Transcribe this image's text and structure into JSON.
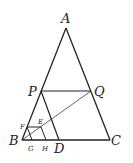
{
  "diagram": {
    "labels": {
      "A": "A",
      "B": "B",
      "C": "C",
      "D": "D",
      "P": "P",
      "Q": "Q",
      "E": "E",
      "F": "F",
      "G": "G",
      "H": "H"
    },
    "points": {
      "A": [
        66,
        28
      ],
      "B": [
        22,
        140
      ],
      "C": [
        110,
        140
      ],
      "D": [
        59,
        140
      ],
      "P": [
        41,
        91
      ],
      "Q": [
        91,
        91
      ],
      "E": [
        41,
        127
      ],
      "F": [
        27,
        127
      ],
      "G": [
        30,
        140
      ],
      "H": [
        44,
        140
      ]
    },
    "segments": [
      [
        "A",
        "B"
      ],
      [
        "A",
        "C"
      ],
      [
        "B",
        "C"
      ],
      [
        "P",
        "Q"
      ],
      [
        "P",
        "D"
      ],
      [
        "B",
        "Q"
      ],
      [
        "F",
        "E"
      ],
      [
        "F",
        "G"
      ],
      [
        "E",
        "H"
      ]
    ]
  }
}
